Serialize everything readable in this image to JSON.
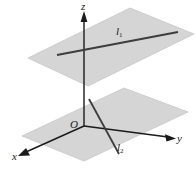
{
  "figure": {
    "background_color": "#ffffff",
    "plane_fill_color": "#d4d4d4",
    "plane_stroke_color": "#bdbdbd",
    "line_color": "#3a3a3a",
    "axis_color": "#1a1a1a",
    "label_color": "#1a1a1a"
  },
  "axes": {
    "z": {
      "label": "z",
      "arrow": "up"
    },
    "x": {
      "label": "x",
      "arrow": "down-left"
    },
    "y": {
      "label": "y",
      "arrow": "right"
    },
    "origin": {
      "label": "O"
    }
  },
  "lines": [
    {
      "name": "l1",
      "label": "l",
      "subscript": "1",
      "plane": "upper"
    },
    {
      "name": "l2",
      "label": "l",
      "subscript": "2",
      "plane": "lower"
    }
  ],
  "planes": [
    {
      "name": "upper-plane",
      "shading": "gray"
    },
    {
      "name": "lower-plane",
      "shading": "gray"
    }
  ]
}
